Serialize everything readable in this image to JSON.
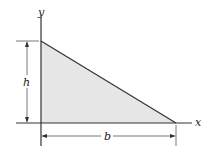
{
  "diagram": {
    "type": "right-triangle-area",
    "axes": {
      "x_label": "x",
      "y_label": "y"
    },
    "dimensions": {
      "height_label": "h",
      "base_label": "b"
    },
    "colors": {
      "fill": "#e6e6e6",
      "stroke": "#333333"
    }
  }
}
